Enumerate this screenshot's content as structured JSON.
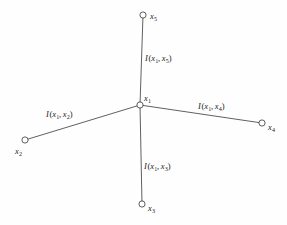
{
  "figure": {
    "type": "star-graph-diagram",
    "background_color": "#fefefe",
    "stroke_color": "#1b1b1b",
    "center_node": {
      "id": "x1",
      "label_var": "x",
      "label_sub": "1",
      "x": 140,
      "y": 105,
      "label_x": 144,
      "label_y": 94
    },
    "leaf_nodes": [
      {
        "id": "x2",
        "label_var": "x",
        "label_sub": "2",
        "x": 25,
        "y": 140,
        "label_x": 15,
        "label_y": 147
      },
      {
        "id": "x3",
        "label_var": "x",
        "label_sub": "3",
        "x": 142,
        "y": 204,
        "label_x": 148,
        "label_y": 204
      },
      {
        "id": "x4",
        "label_var": "x",
        "label_sub": "4",
        "x": 262,
        "y": 123,
        "label_x": 268,
        "label_y": 123
      },
      {
        "id": "x5",
        "label_var": "x",
        "label_sub": "5",
        "x": 143,
        "y": 15,
        "label_x": 150,
        "label_y": 12
      }
    ],
    "edges": [
      {
        "id": "edge-x1-x2",
        "from": "x1",
        "to": "x2",
        "x1": 140,
        "y1": 105,
        "x2": 25,
        "y2": 140,
        "label_fn": "I",
        "label_open": "(",
        "label_arg1_var": "x",
        "label_arg1_sub": "1",
        "label_comma": ",",
        "label_arg2_var": "x",
        "label_arg2_sub": "2",
        "label_close": ")",
        "label_x": 46,
        "label_y": 110
      },
      {
        "id": "edge-x1-x3",
        "from": "x1",
        "to": "x3",
        "x1": 140,
        "y1": 105,
        "x2": 142,
        "y2": 204,
        "label_fn": "I",
        "label_open": "(",
        "label_arg1_var": "x",
        "label_arg1_sub": "1",
        "label_comma": ",",
        "label_arg2_var": "x",
        "label_arg2_sub": "3",
        "label_close": ")",
        "label_x": 144,
        "label_y": 162
      },
      {
        "id": "edge-x1-x4",
        "from": "x1",
        "to": "x4",
        "x1": 140,
        "y1": 105,
        "x2": 262,
        "y2": 123,
        "label_fn": "I",
        "label_open": "(",
        "label_arg1_var": "x",
        "label_arg1_sub": "1",
        "label_comma": ",",
        "label_arg2_var": "x",
        "label_arg2_sub": "4",
        "label_close": ")",
        "label_x": 198,
        "label_y": 102
      },
      {
        "id": "edge-x1-x5",
        "from": "x1",
        "to": "x5",
        "x1": 140,
        "y1": 105,
        "x2": 143,
        "y2": 15,
        "label_fn": "I",
        "label_open": "(",
        "label_arg1_var": "x",
        "label_arg1_sub": "1",
        "label_comma": ",",
        "label_arg2_var": "x",
        "label_arg2_sub": "5",
        "label_close": ")",
        "label_x": 145,
        "label_y": 54
      }
    ]
  }
}
